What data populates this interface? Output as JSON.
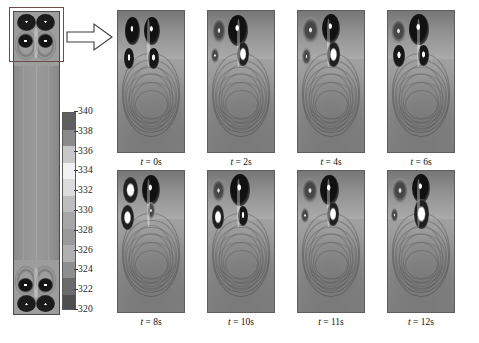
{
  "figure": {
    "type": "scientific-contour-figure",
    "background_color": "#ffffff"
  },
  "domain_panel": {
    "name": "full-height-domain",
    "aspect": "tall-narrow",
    "highlight_box_color": "#6e4a4a",
    "highlight_region": "top"
  },
  "callout": {
    "arrow_name": "right-block-arrow",
    "direction": "right",
    "fill": "#ffffff",
    "stroke": "#333333"
  },
  "colorbar": {
    "name": "temperature-colorbar",
    "units": "K",
    "min": 320,
    "max": 340,
    "tick_step": 2,
    "ticks": [
      340,
      338,
      336,
      334,
      332,
      330,
      328,
      326,
      324,
      322,
      320
    ],
    "segment_colors": [
      "#5f5f5f",
      "#8a8a8a",
      "#c8c8c8",
      "#f2f2f2",
      "#dcdcdc",
      "#bdbdbd",
      "#a6a6a6",
      "#9a9a9a",
      "#b0b0b0",
      "#8e8e8e",
      "#6a6a6a",
      "#4e4e4e"
    ],
    "orientation": "vertical"
  },
  "snapshots": {
    "rows": 2,
    "columns": 4,
    "items": [
      {
        "label": "t = 0s",
        "time_value": 0,
        "time_unit": "s",
        "symmetry": "symmetric",
        "vortex_count": 4
      },
      {
        "label": "t = 2s",
        "time_value": 2,
        "time_unit": "s",
        "symmetry": "asymmetric",
        "vortex_count": 3
      },
      {
        "label": "t = 4s",
        "time_value": 4,
        "time_unit": "s",
        "symmetry": "asymmetric",
        "vortex_count": 4
      },
      {
        "label": "t = 6s",
        "time_value": 6,
        "time_unit": "s",
        "symmetry": "asymmetric",
        "vortex_count": 4
      },
      {
        "label": "t = 8s",
        "time_value": 8,
        "time_unit": "s",
        "symmetry": "asymmetric",
        "vortex_count": 3
      },
      {
        "label": "t = 10s",
        "time_value": 10,
        "time_unit": "s",
        "symmetry": "asymmetric",
        "vortex_count": 4
      },
      {
        "label": "t = 11s",
        "time_value": 11,
        "time_unit": "s",
        "symmetry": "asymmetric",
        "vortex_count": 4
      },
      {
        "label": "t = 12s",
        "time_value": 12,
        "time_unit": "s",
        "symmetry": "asymmetric",
        "vortex_count": 3
      }
    ]
  },
  "chart_data": {
    "type": "heatmap",
    "title": "",
    "xlabel": "",
    "ylabel": "",
    "colorbar_label": "Temperature (K)",
    "colorbar_range": [
      320,
      340
    ],
    "colorbar_ticks": [
      320,
      322,
      324,
      326,
      328,
      330,
      332,
      334,
      336,
      338,
      340
    ],
    "grid": false,
    "legend_position": "none",
    "panel_labels": [
      "t = 0s",
      "t = 2s",
      "t = 4s",
      "t = 6s",
      "t = 8s",
      "t = 10s",
      "t = 11s",
      "t = 12s"
    ],
    "panel_times": [
      0,
      2,
      4,
      6,
      8,
      10,
      11,
      12
    ],
    "series": [
      {
        "name": "t = 0s",
        "values": [
          340,
          336,
          332,
          328,
          324,
          320
        ]
      },
      {
        "name": "t = 2s",
        "values": [
          339,
          335,
          331,
          327,
          323,
          320
        ]
      },
      {
        "name": "t = 4s",
        "values": [
          340,
          337,
          333,
          329,
          325,
          321
        ]
      },
      {
        "name": "t = 6s",
        "values": [
          340,
          336,
          332,
          328,
          324,
          320
        ]
      },
      {
        "name": "t = 8s",
        "values": [
          339,
          336,
          331,
          327,
          323,
          320
        ]
      },
      {
        "name": "t = 10s",
        "values": [
          340,
          337,
          332,
          328,
          324,
          321
        ]
      },
      {
        "name": "t = 11s",
        "values": [
          340,
          336,
          333,
          329,
          325,
          320
        ]
      },
      {
        "name": "t = 12s",
        "values": [
          340,
          337,
          332,
          328,
          324,
          320
        ]
      }
    ]
  }
}
